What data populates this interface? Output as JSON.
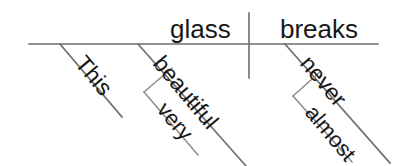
{
  "diagram": {
    "type": "reed-kellogg-sentence-diagram",
    "sentence": "This very beautiful glass almost never breaks.",
    "baseline": {
      "label": "main-baseline",
      "x1": 29,
      "y1": 44,
      "x2": 378,
      "y2": 44
    },
    "divider": {
      "label": "subject-predicate-divider",
      "x1": 249,
      "y1": 13,
      "x2": 249,
      "y2": 78
    },
    "subject": {
      "word": "glass",
      "role": "subject-noun",
      "x": 170,
      "y": 38
    },
    "verb": {
      "word": "breaks",
      "role": "predicate-verb",
      "x": 280,
      "y": 38
    },
    "modifiers": [
      {
        "word": "This",
        "role": "determiner-modifier-of-subject",
        "attaches_to": "glass",
        "line": {
          "x1": 60,
          "y1": 44,
          "x2": 122,
          "y2": 117
        },
        "text_x": 74,
        "text_y": 64,
        "rotate": 50
      },
      {
        "word": "beautiful",
        "role": "adjective-modifier-of-subject",
        "attaches_to": "glass",
        "line": {
          "x1": 138,
          "y1": 44,
          "x2": 246,
          "y2": 166
        },
        "text_x": 152,
        "text_y": 64,
        "rotate": 50
      },
      {
        "word": "very",
        "role": "adverb-modifier-of-adjective",
        "attaches_to": "beautiful",
        "line": {
          "x1": 144,
          "y1": 92,
          "x2": 198,
          "y2": 155
        },
        "branch": {
          "x1": 144,
          "y1": 92,
          "x2": 172,
          "y2": 68
        },
        "text_x": 156,
        "text_y": 110,
        "rotate": 50
      },
      {
        "word": "never",
        "role": "adverb-modifier-of-verb",
        "attaches_to": "breaks",
        "line": {
          "x1": 285,
          "y1": 44,
          "x2": 390,
          "y2": 163
        },
        "text_x": 299,
        "text_y": 64,
        "rotate": 50
      },
      {
        "word": "almost",
        "role": "adverb-modifier-of-adverb",
        "attaches_to": "never",
        "line": {
          "x1": 293,
          "y1": 96,
          "x2": 352,
          "y2": 162
        },
        "branch": {
          "x1": 293,
          "y1": 96,
          "x2": 320,
          "y2": 72
        },
        "text_x": 304,
        "text_y": 113,
        "rotate": 50
      }
    ],
    "colors": {
      "background": "#ffffff",
      "line": "#6e6e6e",
      "line_thin": "#8a8a8a",
      "text": "#171717"
    }
  }
}
